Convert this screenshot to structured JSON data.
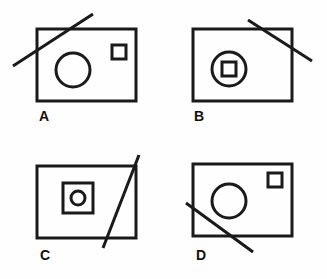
{
  "figure": {
    "background_color": "#fefefe",
    "stroke_color": "#1a1a1a",
    "label_color": "#111111"
  },
  "panels": [
    {
      "id": "A",
      "label": "A",
      "rect": {
        "x": 37,
        "y": 29,
        "width": 99,
        "height": 72
      },
      "circle": {
        "cx": 73,
        "cy": 70,
        "r": 17
      },
      "square": {
        "x": 112,
        "y": 45,
        "width": 14,
        "height": 14
      },
      "line": {
        "x1": 13,
        "y1": 66,
        "x2": 93,
        "y2": 14
      },
      "line_position": "crosses-upper-left-corner"
    },
    {
      "id": "B",
      "label": "B",
      "rect": {
        "x": 193,
        "y": 29,
        "width": 99,
        "height": 72
      },
      "circle": {
        "cx": 229,
        "cy": 69,
        "r": 17
      },
      "inner_square": {
        "x": 222,
        "y": 62,
        "width": 14,
        "height": 14
      },
      "line": {
        "x1": 248,
        "y1": 20,
        "x2": 312,
        "y2": 61
      },
      "line_position": "crosses-upper-right-corner"
    },
    {
      "id": "C",
      "label": "C",
      "rect": {
        "x": 37,
        "y": 166,
        "width": 99,
        "height": 72
      },
      "square": {
        "x": 63,
        "y": 183,
        "width": 30,
        "height": 30
      },
      "circle": {
        "cx": 78,
        "cy": 198,
        "r": 7
      },
      "line": {
        "x1": 103,
        "y1": 248,
        "x2": 139,
        "y2": 155
      },
      "line_position": "crosses-right-side"
    },
    {
      "id": "D",
      "label": "D",
      "rect": {
        "x": 193,
        "y": 164,
        "width": 99,
        "height": 72
      },
      "circle": {
        "cx": 229,
        "cy": 201,
        "r": 17
      },
      "square": {
        "x": 268,
        "y": 173,
        "width": 14,
        "height": 14
      },
      "line": {
        "x1": 186,
        "y1": 203,
        "x2": 253,
        "y2": 252
      },
      "line_position": "crosses-lower-left-corner"
    }
  ]
}
